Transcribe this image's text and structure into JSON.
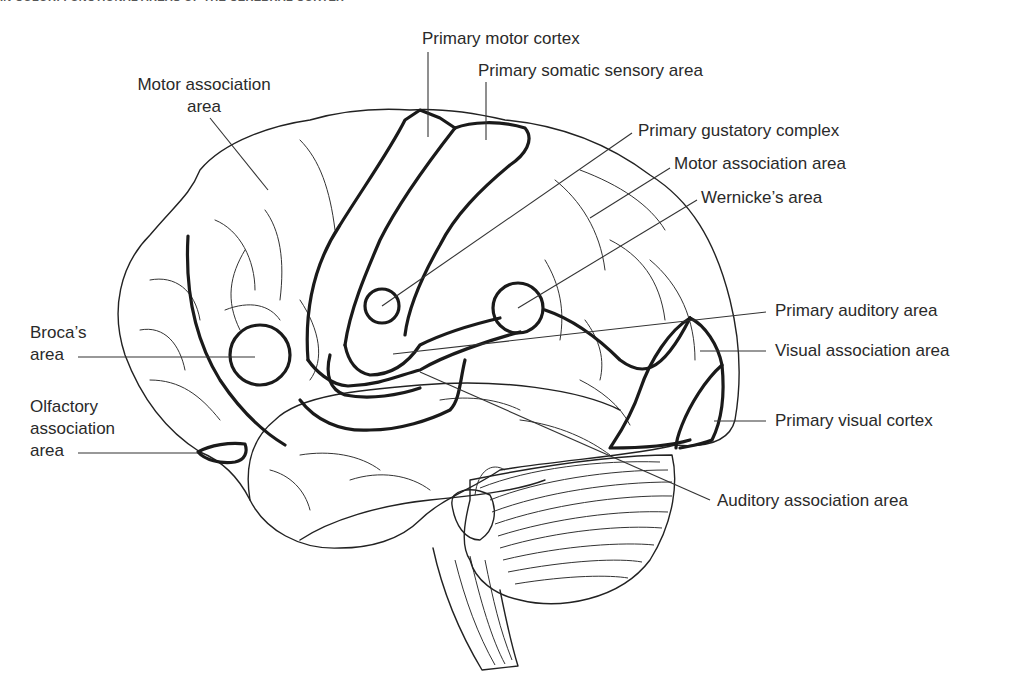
{
  "header": {
    "title": "IN COLOR: FUNCTIONAL AREAS OF THE CEREBRAL CORTEX",
    "page_number": ""
  },
  "diagram": {
    "labels": {
      "motor_association_left_line1": "Motor association",
      "motor_association_left_line2": "area",
      "primary_motor_cortex": "Primary motor cortex",
      "primary_somatic_sensory": "Primary somatic sensory area",
      "primary_gustatory": "Primary gustatory complex",
      "motor_association_right": "Motor association area",
      "wernickes": "Wernicke’s area",
      "primary_auditory": "Primary auditory area",
      "visual_association": "Visual association area",
      "primary_visual": "Primary visual cortex",
      "auditory_association": "Auditory association area",
      "brocas_line1": "Broca’s",
      "brocas_line2": "area",
      "olfactory_line1": "Olfactory",
      "olfactory_line2": "association",
      "olfactory_line3": "area"
    },
    "colors": {
      "line": "#1a1a1a",
      "text": "#2a2a2a",
      "background": "#ffffff"
    }
  }
}
